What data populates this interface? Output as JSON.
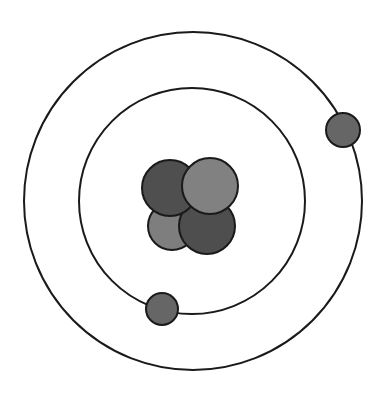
{
  "diagram": {
    "type": "bohr-atom-model",
    "background": "#ffffff",
    "stroke_color": "#1a1a1a",
    "orbits": [
      {
        "name": "inner-orbit",
        "cx": 192,
        "cy": 201,
        "r": 113
      },
      {
        "name": "outer-orbit",
        "cx": 193,
        "cy": 201,
        "r": 169
      }
    ],
    "nucleus": [
      {
        "name": "nucleon-bottom-left",
        "cx": 172,
        "cy": 226,
        "r": 24,
        "fill": "#7e7e7e"
      },
      {
        "name": "nucleon-bottom-right",
        "cx": 207,
        "cy": 226,
        "r": 28,
        "fill": "#4e4e4e"
      },
      {
        "name": "nucleon-top-left",
        "cx": 170,
        "cy": 188,
        "r": 28,
        "fill": "#4f4f4f"
      },
      {
        "name": "nucleon-top-right",
        "cx": 210,
        "cy": 186,
        "r": 28,
        "fill": "#818181"
      }
    ],
    "electrons": [
      {
        "name": "electron-outer",
        "cx": 343,
        "cy": 130,
        "r": 17,
        "fill": "#666666"
      },
      {
        "name": "electron-inner",
        "cx": 162,
        "cy": 309,
        "r": 16,
        "fill": "#666666"
      }
    ]
  }
}
